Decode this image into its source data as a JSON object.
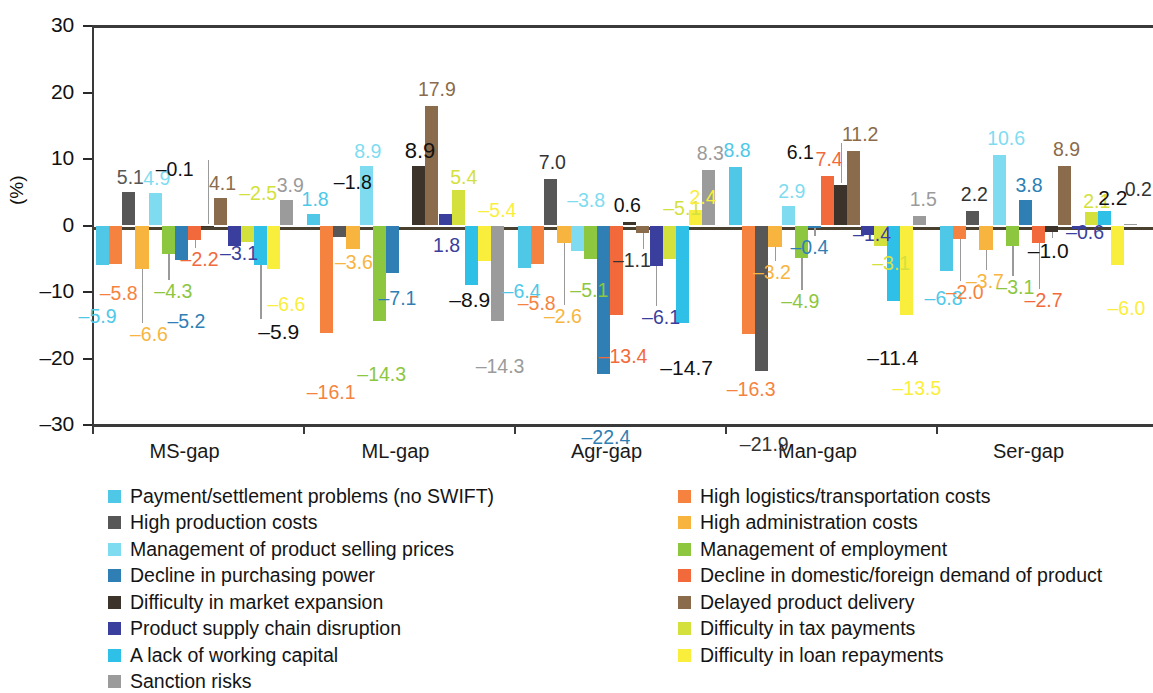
{
  "chart_data": {
    "type": "bar",
    "title": "",
    "xlabel": "",
    "ylabel": "(%)",
    "ylim": [
      -30,
      30
    ],
    "yticks": [
      "30",
      "20",
      "10",
      "0",
      "-10",
      "-20",
      "-30"
    ],
    "ytick_values": [
      30,
      20,
      10,
      0,
      -10,
      -20,
      -30
    ],
    "grid": false,
    "legend_position": "below-two-columns",
    "categories": [
      "MS-gap",
      "ML-gap",
      "Agr-gap",
      "Man-gap",
      "Ser-gap"
    ],
    "series": [
      {
        "name": "Payment/settlement problems (no SWIFT)",
        "color": "#4FC8E8",
        "values": [
          -5.9,
          1.8,
          -6.4,
          8.8,
          -6.8
        ]
      },
      {
        "name": "High logistics/transportation costs",
        "color": "#F5833F",
        "values": [
          -5.8,
          -16.1,
          -5.8,
          -16.3,
          -2.0
        ]
      },
      {
        "name": "High production costs",
        "color": "#575757",
        "values": [
          5.1,
          -1.8,
          7.0,
          -21.9,
          2.2
        ]
      },
      {
        "name": "High administration costs",
        "color": "#F7B53F",
        "values": [
          -6.6,
          -3.6,
          -2.6,
          -3.2,
          -3.7
        ]
      },
      {
        "name": "Management of product selling prices",
        "color": "#7FDCF0",
        "values": [
          4.9,
          8.9,
          -3.8,
          2.9,
          10.6
        ]
      },
      {
        "name": "Management of employment",
        "color": "#8DC63F",
        "values": [
          -4.3,
          -14.3,
          -5.1,
          -4.9,
          -3.1
        ]
      },
      {
        "name": "Decline in purchasing power",
        "color": "#2F7FB5",
        "values": [
          -5.2,
          -7.1,
          -22.4,
          -0.4,
          3.8
        ]
      },
      {
        "name": "Decline in domestic/foreign demand of product",
        "color": "#F26A3C",
        "values": [
          -2.2,
          0.0,
          -13.4,
          7.4,
          -2.7
        ]
      },
      {
        "name": "Difficulty in market expansion",
        "color": "#3C332B",
        "values": [
          -0.1,
          8.9,
          0.6,
          6.1,
          -1.0
        ]
      },
      {
        "name": "Delayed product delivery",
        "color": "#8A6B4B",
        "values": [
          4.1,
          17.9,
          -1.1,
          11.2,
          8.9
        ]
      },
      {
        "name": "Product supply chain disruption",
        "color": "#3A3E9C",
        "values": [
          -3.1,
          1.8,
          -6.1,
          -1.4,
          -0.6
        ]
      },
      {
        "name": "Difficulty in tax payments",
        "color": "#D4E13C",
        "values": [
          -2.5,
          5.4,
          -5.1,
          -3.1,
          2.1
        ]
      },
      {
        "name": "A lack of working capital",
        "color": "#2FC0E8",
        "values": [
          -5.9,
          -8.9,
          -14.7,
          -11.4,
          2.2
        ]
      },
      {
        "name": "Difficulty in loan repayments",
        "color": "#FAEE3C",
        "values": [
          -6.6,
          -5.4,
          2.4,
          -13.5,
          -6.0
        ]
      },
      {
        "name": "Sanction risks",
        "color": "#9B9B9B",
        "values": [
          3.9,
          -14.3,
          8.3,
          1.5,
          0.2
        ]
      }
    ],
    "value_labels": {
      "MS-gap": [
        "-5.9",
        "-5.8",
        "5.1",
        "-6.6",
        "4.9",
        "-4.3",
        "-5.2",
        "-2.2",
        "-0.1",
        "4.1",
        "-3.1",
        "-2.5",
        "-5.9",
        "-6.6",
        "3.9"
      ],
      "ML-gap": [
        "1.8",
        "-16.1",
        "-1.8",
        "-3.6",
        "8.9",
        "-14.3",
        "-7.1",
        "",
        "8.9",
        "17.9",
        "1.8",
        "5.4",
        "-8.9",
        "-5.4",
        "-14.3"
      ],
      "Agr-gap": [
        "-6.4",
        "-5.8",
        "7.0",
        "-2.6",
        "-3.8",
        "-5.1",
        "-22.4",
        "-13.4",
        "0.6",
        "-1.1",
        "-6.1",
        "-5.1",
        "-14.7",
        "2.4",
        "8.3"
      ],
      "Man-gap": [
        "8.8",
        "-16.3",
        "-21.9",
        "-3.2",
        "2.9",
        "-4.9",
        "-0.4",
        "7.4",
        "6.1",
        "11.2",
        "-1.4",
        "-3.1",
        "-11.4",
        "-13.5",
        "1.5"
      ],
      "Ser-gap": [
        "-6.8",
        "-2.0",
        "2.2",
        "-3.7",
        "10.6",
        "-3.1",
        "3.8",
        "-2.7",
        "-1.0",
        "8.9",
        "-0.6",
        "2.1",
        "2.2",
        "-6.0",
        "0.2"
      ]
    }
  },
  "legend": {
    "left_column": [
      {
        "label": "Payment/settlement problems (no SWIFT)",
        "color": "#4FC8E8"
      },
      {
        "label": "High production costs",
        "color": "#575757"
      },
      {
        "label": "Management of product selling prices",
        "color": "#7FDCF0"
      },
      {
        "label": "Decline in purchasing power",
        "color": "#2F7FB5"
      },
      {
        "label": "Difficulty in market expansion",
        "color": "#3C332B"
      },
      {
        "label": "Product supply chain disruption",
        "color": "#3A3E9C"
      },
      {
        "label": "A lack of working capital",
        "color": "#2FC0E8"
      },
      {
        "label": "Sanction risks",
        "color": "#9B9B9B"
      }
    ],
    "right_column": [
      {
        "label": "High logistics/transportation costs",
        "color": "#F5833F"
      },
      {
        "label": "High administration costs",
        "color": "#F7B53F"
      },
      {
        "label": "Management of employment",
        "color": "#8DC63F"
      },
      {
        "label": "Decline in domestic/foreign demand of product",
        "color": "#F26A3C"
      },
      {
        "label": "Delayed product delivery",
        "color": "#8A6B4B"
      },
      {
        "label": "Difficulty in tax payments",
        "color": "#D4E13C"
      },
      {
        "label": "Difficulty in loan repayments",
        "color": "#FAEE3C"
      }
    ]
  }
}
